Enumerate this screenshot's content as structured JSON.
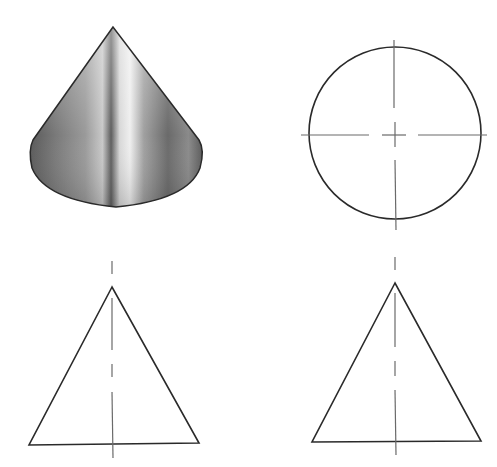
{
  "figure": {
    "views": [
      {
        "name": "isometric-shaded-view",
        "description": "Shaded 3D cone"
      },
      {
        "name": "top-view",
        "description": "Circle with center lines"
      },
      {
        "name": "front-view",
        "description": "Triangle with vertical center line"
      },
      {
        "name": "side-view",
        "description": "Triangle with vertical center line"
      }
    ]
  },
  "colors": {
    "line": "#2a2a2a",
    "centerline": "#6a6a6a",
    "shade_dark": "#3a3a3a",
    "shade_light": "#e8e8e8",
    "background": "#ffffff"
  }
}
